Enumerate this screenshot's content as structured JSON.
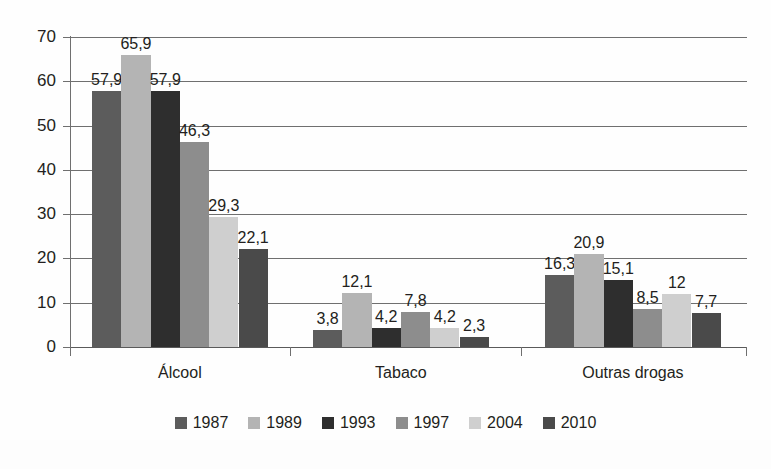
{
  "chart_data": {
    "type": "bar",
    "title": "",
    "subtitle": "",
    "xlabel": "",
    "ylabel": "",
    "ylim": [
      0,
      70
    ],
    "ytick_step": 10,
    "yticks": [
      "0",
      "10",
      "20",
      "30",
      "40",
      "50",
      "60",
      "70"
    ],
    "grid": true,
    "grid_axis": "y",
    "legend_position": "bottom",
    "decimal_separator": ",",
    "categories": [
      "Álcool",
      "Tabaco",
      "Outras drogas"
    ],
    "series": [
      {
        "name": "1987",
        "color": "#5c5c5c",
        "values": [
          57.9,
          3.8,
          16.3
        ],
        "labels": [
          "57,9",
          "3,8",
          "16,3"
        ]
      },
      {
        "name": "1989",
        "color": "#b4b4b4",
        "values": [
          65.9,
          12.1,
          20.9
        ],
        "labels": [
          "65,9",
          "12,1",
          "20,9"
        ]
      },
      {
        "name": "1993",
        "color": "#2e2e2e",
        "values": [
          57.9,
          4.2,
          15.1
        ],
        "labels": [
          "57,9",
          "4,2",
          "15,1"
        ]
      },
      {
        "name": "1997",
        "color": "#8d8d8d",
        "values": [
          46.3,
          7.8,
          8.5
        ],
        "labels": [
          "46,3",
          "7,8",
          "8,5"
        ]
      },
      {
        "name": "2004",
        "color": "#cfcfcf",
        "values": [
          29.3,
          4.2,
          12.0
        ],
        "labels": [
          "29,3",
          "4,2",
          "12"
        ]
      },
      {
        "name": "2010",
        "color": "#4a4a4a",
        "values": [
          22.1,
          2.3,
          7.7
        ],
        "labels": [
          "22,1",
          "2,3",
          "7,7"
        ]
      }
    ]
  },
  "legend": {
    "items": [
      {
        "label": "1987",
        "color": "#5c5c5c"
      },
      {
        "label": "1989",
        "color": "#b4b4b4"
      },
      {
        "label": "1993",
        "color": "#2e2e2e"
      },
      {
        "label": "1997",
        "color": "#8d8d8d"
      },
      {
        "label": "2004",
        "color": "#cfcfcf"
      },
      {
        "label": "2010",
        "color": "#4a4a4a"
      }
    ]
  },
  "axis": {
    "y_labels": [
      "70",
      "60",
      "50",
      "40",
      "30",
      "20",
      "10",
      "0"
    ]
  }
}
